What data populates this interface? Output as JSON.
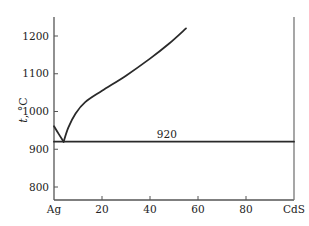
{
  "chart_data": {
    "type": "line",
    "title": "",
    "xlabel": "",
    "ylabel": "t, °C",
    "ylabel_var": "t",
    "ylabel_unit": ", °C",
    "xlim": [
      0,
      100
    ],
    "ylim": [
      765,
      1250
    ],
    "x_ticks": [
      {
        "value": 0,
        "label": "Ag"
      },
      {
        "value": 20,
        "label": "20"
      },
      {
        "value": 40,
        "label": "40"
      },
      {
        "value": 60,
        "label": "60"
      },
      {
        "value": 80,
        "label": "80"
      },
      {
        "value": 100,
        "label": "CdS"
      }
    ],
    "y_ticks": [
      {
        "value": 800,
        "label": "800"
      },
      {
        "value": 900,
        "label": "900"
      },
      {
        "value": 1000,
        "label": "1000"
      },
      {
        "value": 1100,
        "label": "1100"
      },
      {
        "value": 1200,
        "label": "1200"
      }
    ],
    "grid": false,
    "series": [
      {
        "name": "liquidus-Ag-side",
        "x": [
          0,
          2,
          4
        ],
        "y": [
          961,
          940,
          920
        ]
      },
      {
        "name": "liquidus-CdS-side",
        "x": [
          4,
          6,
          9,
          13,
          20,
          30,
          40,
          48,
          55
        ],
        "y": [
          920,
          958,
          995,
          1025,
          1055,
          1095,
          1140,
          1180,
          1220
        ]
      },
      {
        "name": "eutectic-line",
        "x": [
          0,
          100
        ],
        "y": [
          920,
          920
        ]
      }
    ],
    "annotations": [
      {
        "text": "920",
        "x": 47,
        "y": 920
      }
    ]
  }
}
